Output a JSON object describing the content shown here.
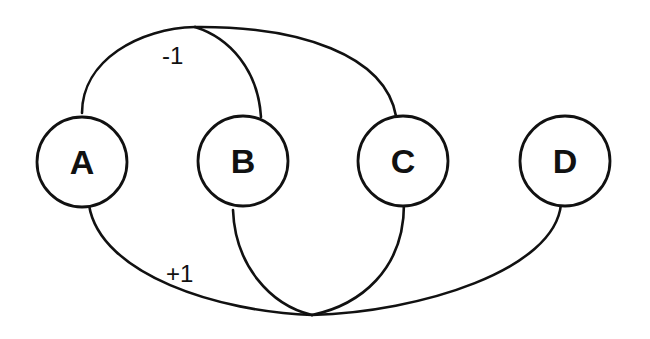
{
  "diagram": {
    "type": "hypergraph",
    "colors": {
      "stroke": "#111111",
      "background": "#ffffff"
    },
    "nodes": [
      {
        "id": "A",
        "label": "A"
      },
      {
        "id": "B",
        "label": "B"
      },
      {
        "id": "C",
        "label": "C"
      },
      {
        "id": "D",
        "label": "D"
      }
    ],
    "hyperedges": [
      {
        "id": "top",
        "label": "-1",
        "connects": [
          "A",
          "B",
          "C"
        ]
      },
      {
        "id": "bottom",
        "label": "+1",
        "connects": [
          "A",
          "B",
          "C",
          "D"
        ]
      }
    ]
  }
}
